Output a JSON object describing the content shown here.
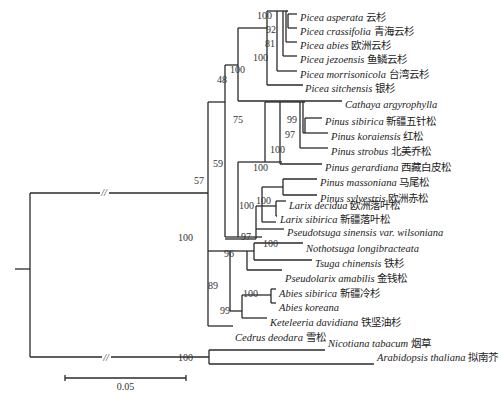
{
  "figure": {
    "type": "phylogenetic_tree",
    "scale_bar": {
      "label": "0.05",
      "x1": 65,
      "x2": 186,
      "y": 378
    }
  },
  "taxa": [
    {
      "id": "t1",
      "name": "Picea asperata",
      "cn": "云杉",
      "x": 300,
      "y": 17
    },
    {
      "id": "t2",
      "name": "Picea crassifolia",
      "cn": "青海云杉",
      "x": 300,
      "y": 31
    },
    {
      "id": "t3",
      "name": "Picea abies",
      "cn": "欧洲云杉",
      "x": 300,
      "y": 45
    },
    {
      "id": "t4",
      "name": "Picea jezoensis",
      "cn": "鱼鳞云杉",
      "x": 300,
      "y": 59
    },
    {
      "id": "t5",
      "name": "Picea morrisonicola",
      "cn": "台湾云杉",
      "x": 300,
      "y": 74
    },
    {
      "id": "t6",
      "name": "Picea sitchensis",
      "cn": "银杉",
      "x": 305,
      "y": 88
    },
    {
      "id": "t7",
      "name": "Cathaya argyrophylla",
      "cn": "",
      "x": 345,
      "y": 104
    },
    {
      "id": "t8",
      "name": "Pinus sibirica",
      "cn": "新疆五针松",
      "x": 325,
      "y": 121
    },
    {
      "id": "t9",
      "name": "Pinus koraiensis",
      "cn": "红松",
      "x": 331,
      "y": 136
    },
    {
      "id": "t10",
      "name": "Pinus strobus",
      "cn": "北美乔松",
      "x": 331,
      "y": 151
    },
    {
      "id": "t11",
      "name": "Pinus gerardiana",
      "cn": "西藏白皮松",
      "x": 325,
      "y": 167
    },
    {
      "id": "t12",
      "name": "Pinus massoniana",
      "cn": "马尾松",
      "x": 320,
      "y": 182
    },
    {
      "id": "t13",
      "name": "Pinus sylvestris",
      "cn": "欧洲赤松",
      "x": 320,
      "y": 198
    },
    {
      "id": "t14",
      "name": "Larix decidua",
      "cn": "欧洲落叶松",
      "x": 289,
      "y": 205
    },
    {
      "id": "t15",
      "name": "Larix sibirica",
      "cn": "新疆落叶松",
      "x": 280,
      "y": 219
    },
    {
      "id": "t16",
      "name": "Pseudotsuga sinensis var. wilsoniana",
      "cn": "",
      "x": 287,
      "y": 232
    },
    {
      "id": "t17",
      "name": "Nothotsuga longibracteata",
      "cn": "",
      "x": 306,
      "y": 248
    },
    {
      "id": "t18",
      "name": "Tsuga chinensis",
      "cn": "铁杉",
      "x": 315,
      "y": 263
    },
    {
      "id": "t19",
      "name": "Pseudolarix amabilis",
      "cn": "金钱松",
      "x": 285,
      "y": 278
    },
    {
      "id": "t20",
      "name": "Abies sibirica",
      "cn": "新疆冷杉",
      "x": 279,
      "y": 293
    },
    {
      "id": "t21",
      "name": "Abies koreana",
      "cn": "",
      "x": 279,
      "y": 307
    },
    {
      "id": "t22",
      "name": "Keteleeria davidiana",
      "cn": "铁坚油杉",
      "x": 270,
      "y": 322
    },
    {
      "id": "t23",
      "name": "Cedrus deodara",
      "cn": "雪松",
      "x": 235,
      "y": 337
    },
    {
      "id": "t24",
      "name": "Nicotiana tabacum",
      "cn": "烟草",
      "x": 328,
      "y": 343
    },
    {
      "id": "t25",
      "name": "Arabidopsis thaliana",
      "cn": "拟南芥",
      "x": 377,
      "y": 357
    }
  ],
  "branches": [
    [
      15,
      269,
      30,
      269
    ],
    [
      30,
      193,
      30,
      357
    ],
    [
      30,
      193,
      208,
      193
    ],
    [
      30,
      357,
      209,
      357
    ],
    [
      208,
      102,
      208,
      326
    ],
    [
      208,
      326,
      233,
      326
    ],
    [
      208,
      102,
      225,
      102
    ],
    [
      225,
      65,
      225,
      237
    ],
    [
      225,
      65,
      238,
      65
    ],
    [
      238,
      28,
      238,
      101
    ],
    [
      238,
      101,
      342,
      101
    ],
    [
      238,
      28,
      267,
      28
    ],
    [
      267,
      11,
      267,
      85
    ],
    [
      267,
      85,
      303,
      85
    ],
    [
      267,
      11,
      277,
      11
    ],
    [
      277,
      11,
      277,
      71
    ],
    [
      277,
      71,
      297,
      71
    ],
    [
      277,
      11,
      283,
      11
    ],
    [
      283,
      11,
      283,
      56
    ],
    [
      283,
      56,
      297,
      56
    ],
    [
      283,
      11,
      286,
      11
    ],
    [
      286,
      11,
      286,
      42
    ],
    [
      286,
      42,
      297,
      42
    ],
    [
      286,
      11,
      288,
      11
    ],
    [
      288,
      14,
      288,
      28
    ],
    [
      288,
      14,
      297,
      14
    ],
    [
      288,
      28,
      297,
      28
    ],
    [
      225,
      237,
      238,
      237
    ],
    [
      238,
      237,
      238,
      162
    ],
    [
      238,
      162,
      265,
      162
    ],
    [
      238,
      237,
      262,
      237
    ],
    [
      265,
      162,
      265,
      102
    ],
    [
      265,
      102,
      280,
      102
    ],
    [
      280,
      102,
      280,
      164
    ],
    [
      280,
      164,
      322,
      164
    ],
    [
      280,
      102,
      300,
      102
    ],
    [
      300,
      102,
      300,
      148
    ],
    [
      300,
      148,
      328,
      148
    ],
    [
      300,
      102,
      303,
      102
    ],
    [
      303,
      102,
      303,
      133
    ],
    [
      303,
      133,
      328,
      133
    ],
    [
      303,
      102,
      305,
      102
    ],
    [
      305,
      118,
      305,
      133
    ],
    [
      305,
      118,
      322,
      118
    ],
    [
      265,
      162,
      282,
      162
    ],
    [
      262,
      187,
      262,
      222
    ],
    [
      262,
      187,
      283,
      187
    ],
    [
      283,
      179,
      283,
      195
    ],
    [
      283,
      179,
      317,
      179
    ],
    [
      283,
      195,
      317,
      195
    ],
    [
      262,
      222,
      276,
      222
    ],
    [
      225,
      237,
      225,
      237
    ],
    [
      225,
      239,
      256,
      239
    ],
    [
      256,
      229,
      256,
      239
    ],
    [
      256,
      229,
      284,
      229
    ],
    [
      256,
      206,
      256,
      229
    ],
    [
      256,
      206,
      276,
      206
    ],
    [
      276,
      201,
      276,
      216
    ],
    [
      276,
      201,
      286,
      201
    ],
    [
      276,
      216,
      277,
      216
    ],
    [
      208,
      251,
      230,
      251
    ],
    [
      230,
      251,
      230,
      311
    ],
    [
      230,
      251,
      247,
      251
    ],
    [
      247,
      251,
      247,
      270
    ],
    [
      247,
      270,
      282,
      270
    ],
    [
      247,
      251,
      254,
      251
    ],
    [
      254,
      243,
      254,
      260
    ],
    [
      254,
      243,
      303,
      243
    ],
    [
      254,
      260,
      312,
      260
    ],
    [
      230,
      311,
      242,
      311
    ],
    [
      242,
      295,
      242,
      318
    ],
    [
      242,
      318,
      267,
      318
    ],
    [
      242,
      295,
      271,
      295
    ],
    [
      271,
      289,
      271,
      303
    ],
    [
      271,
      289,
      276,
      289
    ],
    [
      271,
      303,
      276,
      303
    ],
    [
      209,
      350,
      209,
      364
    ],
    [
      209,
      350,
      325,
      350
    ],
    [
      209,
      364,
      374,
      364
    ]
  ],
  "supports": [
    {
      "v": "100",
      "x": 272,
      "y": 19
    },
    {
      "v": "92",
      "x": 276,
      "y": 33
    },
    {
      "v": "81",
      "x": 275,
      "y": 47
    },
    {
      "v": "100",
      "x": 268,
      "y": 61
    },
    {
      "v": "100",
      "x": 245,
      "y": 73
    },
    {
      "v": "48",
      "x": 227,
      "y": 83
    },
    {
      "v": "75",
      "x": 243,
      "y": 123
    },
    {
      "v": "99",
      "x": 297,
      "y": 123
    },
    {
      "v": "97",
      "x": 295,
      "y": 138
    },
    {
      "v": "100",
      "x": 285,
      "y": 153
    },
    {
      "v": "100",
      "x": 268,
      "y": 171
    },
    {
      "v": "100",
      "x": 271,
      "y": 204
    },
    {
      "v": "59",
      "x": 223,
      "y": 167
    },
    {
      "v": "100",
      "x": 254,
      "y": 209
    },
    {
      "v": "97",
      "x": 251,
      "y": 240
    },
    {
      "v": "57",
      "x": 204,
      "y": 184
    },
    {
      "v": "100",
      "x": 193,
      "y": 241
    },
    {
      "v": "100",
      "x": 278,
      "y": 247
    },
    {
      "v": "96",
      "x": 234,
      "y": 257
    },
    {
      "v": "89",
      "x": 218,
      "y": 289
    },
    {
      "v": "100",
      "x": 258,
      "y": 297
    },
    {
      "v": "99",
      "x": 230,
      "y": 314
    },
    {
      "v": "100",
      "x": 193,
      "y": 361
    }
  ],
  "breaks": [
    {
      "label": "//",
      "x": 104,
      "y": 196
    },
    {
      "label": "//",
      "x": 106,
      "y": 361
    }
  ]
}
